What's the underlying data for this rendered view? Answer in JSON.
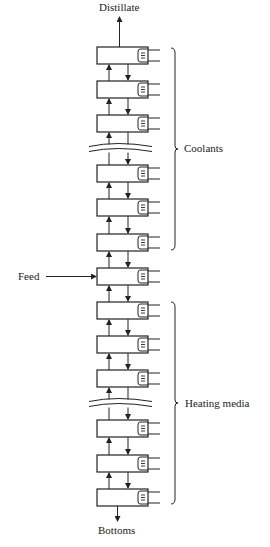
{
  "diagram": {
    "labels": {
      "top_product": "Distillate",
      "bottom_product": "Bottoms",
      "feed": "Feed",
      "upper_group": "Coolants",
      "lower_group": "Heating media"
    },
    "stages": {
      "box_x": 97,
      "box_width": 51,
      "box_height": 17,
      "coil_width": 9,
      "line_end_x": 160,
      "tops": [
        47,
        81,
        115,
        165,
        199,
        234,
        268,
        302,
        336,
        370,
        420,
        455,
        489
      ],
      "feed_stage_index": 6,
      "breaks_after_index": [
        2,
        9
      ]
    },
    "braces": {
      "coolants": {
        "x": 175,
        "y1": 48,
        "y2": 250
      },
      "heating": {
        "x": 175,
        "y1": 302,
        "y2": 504
      }
    },
    "colors": {
      "line": "#222222",
      "accent_red": "#c0392b",
      "accent_blue": "#3b4fb0",
      "accent_green": "#2e8b57",
      "accent_magenta": "#b23aa0"
    }
  }
}
